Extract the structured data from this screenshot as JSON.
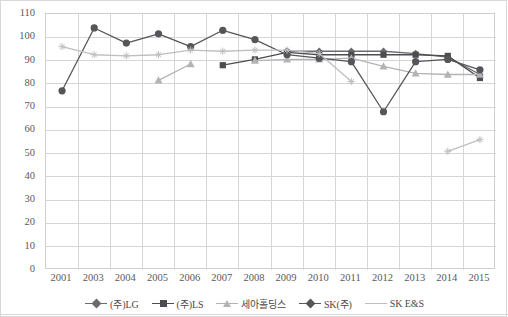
{
  "chart": {
    "title": "",
    "background": "#ffffff",
    "plot_border_color": "#cfcfcf",
    "grid_color": "#d6d6d6"
  },
  "y_axis": {
    "min": 0,
    "max": 110,
    "step": 10,
    "ticks": [
      "0",
      "10",
      "20",
      "30",
      "40",
      "50",
      "60",
      "70",
      "80",
      "90",
      "100",
      "110"
    ],
    "label": ""
  },
  "x_axis": {
    "label": "",
    "ticks": [
      "2001",
      "2003",
      "2004",
      "2005",
      "2006",
      "2007",
      "2008",
      "2009",
      "2010",
      "2011",
      "2012",
      "2013",
      "2014",
      "2015"
    ]
  },
  "legend": {
    "position": "bottom",
    "items": [
      {
        "label": "(주)LG",
        "marker": "diamond",
        "color": "#6b6b6f"
      },
      {
        "label": "(주)LS",
        "marker": "square",
        "color": "#4d4d51"
      },
      {
        "label": "세아홀딩스",
        "marker": "triangle",
        "color": "#b3b3b6"
      },
      {
        "label": "SK(주)",
        "marker": "diamond",
        "color": "#55555a"
      },
      {
        "label": "SK E&S",
        "marker": "line",
        "color": "#bfbfc2"
      }
    ]
  },
  "chart_data": {
    "type": "line",
    "title": "",
    "xlabel": "",
    "ylabel": "",
    "ylim": [
      0,
      110
    ],
    "grid": true,
    "legend_position": "bottom",
    "categories": [
      "2001",
      "2003",
      "2004",
      "2005",
      "2006",
      "2007",
      "2008",
      "2009",
      "2010",
      "2011",
      "2012",
      "2013",
      "2014",
      "2015"
    ],
    "series": [
      {
        "name": "(주)LG",
        "marker": "diamond",
        "color": "#6b6b6f",
        "values": [
          null,
          null,
          null,
          null,
          null,
          null,
          null,
          94,
          94,
          94,
          94,
          93,
          91.5,
          84
        ]
      },
      {
        "name": "(주)LS",
        "marker": "square",
        "color": "#4d4d51",
        "values": [
          null,
          null,
          null,
          null,
          null,
          88,
          90.5,
          93.5,
          92.5,
          92.5,
          92.5,
          92.5,
          92,
          82.5
        ]
      },
      {
        "name": "세아홀딩스",
        "marker": "triangle",
        "color": "#b3b3b6",
        "values": [
          null,
          null,
          null,
          81.5,
          88.5,
          null,
          90,
          90.5,
          90.5,
          91,
          87.5,
          84.5,
          84,
          84
        ]
      },
      {
        "name": "SK(주)",
        "marker": "circle",
        "color": "#55555a",
        "values": [
          77,
          104,
          97.5,
          101.5,
          96,
          103,
          99,
          92.5,
          91,
          89.5,
          68,
          89.5,
          90.5,
          86
        ]
      },
      {
        "name": "SK E&S",
        "marker": "star",
        "color": "#bfbfc2",
        "values": [
          96,
          92.5,
          92,
          92.5,
          94.5,
          94,
          94.5,
          94.5,
          93,
          81,
          null,
          null,
          51,
          56
        ]
      }
    ]
  }
}
